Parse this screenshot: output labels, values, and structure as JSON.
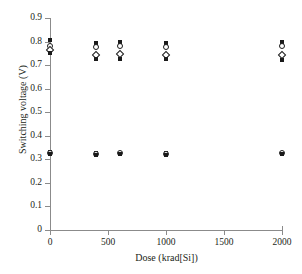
{
  "chart_data": {
    "type": "scatter",
    "title": "",
    "xlabel": "Dose (krad[Si])",
    "ylabel": "Switching voltage (V)",
    "xlim": [
      0,
      2000
    ],
    "ylim": [
      0,
      0.9
    ],
    "xticks": [
      0,
      500,
      1000,
      1500,
      2000
    ],
    "xtick_labels": [
      "0",
      "500",
      "1000",
      "1500",
      "2000"
    ],
    "yticks": [
      0,
      0.1,
      0.2,
      0.3,
      0.4,
      0.5,
      0.6,
      0.7,
      0.8,
      0.9
    ],
    "ytick_labels": [
      "0",
      "0.1",
      "0.2",
      "0.3",
      "0.4",
      "0.5",
      "0.6",
      "0.7",
      "0.8",
      "0.9"
    ],
    "grid": false,
    "legend": "none",
    "dose_levels": [
      0,
      400,
      600,
      1000,
      2000
    ],
    "series": [
      {
        "name": "upper-band-high",
        "marker": "filled-square",
        "x": [
          0,
          400,
          600,
          1000,
          2000
        ],
        "y": [
          0.805,
          0.793,
          0.796,
          0.793,
          0.797
        ]
      },
      {
        "name": "upper-band-open-upper",
        "marker": "open-circle",
        "x": [
          0,
          400,
          600,
          1000,
          2000
        ],
        "y": [
          0.782,
          0.778,
          0.783,
          0.777,
          0.781
        ]
      },
      {
        "name": "upper-band-open-lower",
        "marker": "open-diamond",
        "x": [
          0,
          400,
          600,
          1000,
          2000
        ],
        "y": [
          0.766,
          0.745,
          0.749,
          0.744,
          0.744
        ]
      },
      {
        "name": "upper-band-low",
        "marker": "filled-square",
        "x": [
          0,
          400,
          600,
          1000,
          2000
        ],
        "y": [
          0.752,
          0.728,
          0.727,
          0.727,
          0.722
        ]
      },
      {
        "name": "lower-band-a",
        "marker": "filled-square",
        "x": [
          0,
          400,
          600,
          1000,
          2000
        ],
        "y": [
          0.333,
          0.328,
          0.329,
          0.328,
          0.329
        ]
      },
      {
        "name": "lower-band-b",
        "marker": "open-circle",
        "x": [
          0,
          400,
          600,
          1000,
          2000
        ],
        "y": [
          0.327,
          0.324,
          0.325,
          0.324,
          0.325
        ]
      },
      {
        "name": "lower-band-c",
        "marker": "filled-square",
        "x": [
          0,
          400,
          600,
          1000,
          2000
        ],
        "y": [
          0.321,
          0.32,
          0.321,
          0.32,
          0.321
        ]
      }
    ]
  },
  "colors": {
    "axis": "#8b8b8b",
    "marker": "#1a1a1a",
    "text": "#231f20",
    "background": "#ffffff"
  }
}
